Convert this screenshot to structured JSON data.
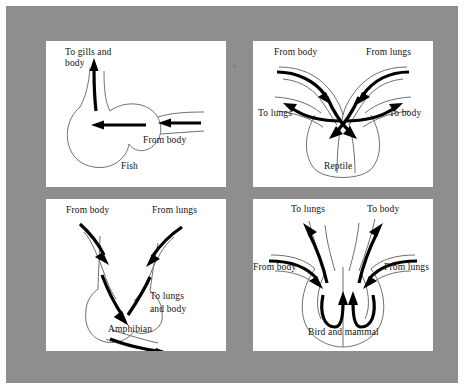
{
  "figure": {
    "background_color": "#8e8e8e",
    "panel_color": "#ffffff",
    "outline_color": "#6f6f6f",
    "arrow_color": "#000000"
  },
  "panels": [
    {
      "id": "fish",
      "caption": "Fish",
      "labels": [
        {
          "name": "to-gills-and-body",
          "line1": "To gills and",
          "line2": "body"
        },
        {
          "name": "from-body",
          "line1": "From body",
          "line2": ""
        }
      ],
      "flow_arrows": [
        {
          "name": "outflow-arrow",
          "label": "To gills and body",
          "direction": "up"
        },
        {
          "name": "inflow-arrow",
          "label": "From body",
          "direction": "left"
        }
      ]
    },
    {
      "id": "reptile",
      "caption": "Reptile",
      "labels": [
        {
          "name": "from-body",
          "line1": "From body",
          "line2": ""
        },
        {
          "name": "from-lungs",
          "line1": "From lungs",
          "line2": ""
        },
        {
          "name": "to-lungs",
          "line1": "To lungs",
          "line2": ""
        },
        {
          "name": "to-body",
          "line1": "To body",
          "line2": ""
        }
      ],
      "flow_arrows": [
        {
          "name": "from-body-arrow",
          "label": "From body",
          "direction": "down-right"
        },
        {
          "name": "from-lungs-arrow",
          "label": "From lungs",
          "direction": "down-left"
        },
        {
          "name": "to-lungs-arrow",
          "label": "To lungs",
          "direction": "left"
        },
        {
          "name": "to-body-arrow",
          "label": "To body",
          "direction": "right"
        }
      ]
    },
    {
      "id": "amphibian",
      "caption": "Amphibian",
      "labels": [
        {
          "name": "from-body",
          "line1": "From body",
          "line2": ""
        },
        {
          "name": "from-lungs",
          "line1": "From lungs",
          "line2": ""
        },
        {
          "name": "to-lungs-and-body",
          "line1": "To lungs",
          "line2": "and body"
        }
      ],
      "flow_arrows": [
        {
          "name": "from-body-arrow",
          "label": "From body",
          "direction": "down-right"
        },
        {
          "name": "from-lungs-arrow",
          "label": "From lungs",
          "direction": "down-left"
        },
        {
          "name": "outflow-arrow",
          "label": "To lungs and body",
          "direction": "down-right"
        }
      ]
    },
    {
      "id": "bird-and-mammal",
      "caption": "Bird and mammal",
      "labels": [
        {
          "name": "to-lungs",
          "line1": "To lungs",
          "line2": ""
        },
        {
          "name": "to-body",
          "line1": "To body",
          "line2": ""
        },
        {
          "name": "from-body",
          "line1": "From body",
          "line2": ""
        },
        {
          "name": "from-lungs",
          "line1": "From lungs",
          "line2": ""
        }
      ],
      "flow_arrows": [
        {
          "name": "to-lungs-arrow",
          "label": "To lungs",
          "direction": "up-left"
        },
        {
          "name": "to-body-arrow",
          "label": "To body",
          "direction": "up-right"
        },
        {
          "name": "from-body-arrow",
          "label": "From body",
          "direction": "down-right"
        },
        {
          "name": "from-lungs-arrow",
          "label": "From lungs",
          "direction": "down-left"
        }
      ]
    }
  ]
}
